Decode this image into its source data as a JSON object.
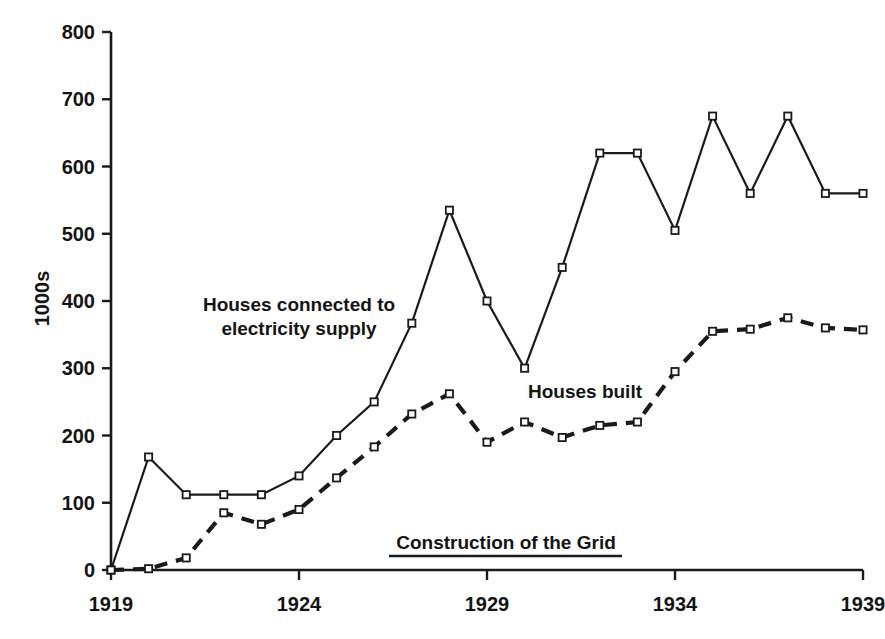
{
  "chart_data": {
    "type": "line",
    "title": "",
    "xlabel": "",
    "ylabel": "1000s",
    "xlim": [
      1919,
      1939
    ],
    "ylim": [
      0,
      800
    ],
    "grid": false,
    "legend_position": "inline-annotations",
    "x": [
      1919,
      1920,
      1921,
      1922,
      1923,
      1924,
      1925,
      1926,
      1927,
      1928,
      1929,
      1930,
      1931,
      1932,
      1933,
      1934,
      1935,
      1936,
      1937,
      1938,
      1939
    ],
    "xticks": [
      1919,
      1924,
      1929,
      1934,
      1939
    ],
    "yticks": [
      0,
      100,
      200,
      300,
      400,
      500,
      600,
      700,
      800
    ],
    "series": [
      {
        "name": "Houses connected to electricity supply",
        "style": "solid",
        "marker": "open-square",
        "color": "#1a1a1a",
        "values": [
          0,
          168,
          112,
          112,
          112,
          140,
          200,
          250,
          367,
          535,
          400,
          300,
          450,
          620,
          620,
          505,
          675,
          560,
          675,
          560,
          560
        ]
      },
      {
        "name": "Houses built",
        "style": "dashed",
        "marker": "open-square",
        "color": "#1a1a1a",
        "values": [
          0,
          2,
          18,
          85,
          68,
          90,
          137,
          183,
          232,
          262,
          190,
          220,
          197,
          215,
          220,
          295,
          355,
          358,
          375,
          360,
          357
        ]
      }
    ],
    "annotations": [
      {
        "name": "series-label-electricity",
        "text": "Houses connected to\nelectricity supply",
        "x_px": 299,
        "y_px": 317
      },
      {
        "name": "series-label-houses-built",
        "text": "Houses built",
        "x_px": 585,
        "y_px": 392
      },
      {
        "name": "period-label-grid",
        "text": "Construction of the Grid",
        "underline": true,
        "x_px": 506,
        "y_px": 543,
        "underline_x1_px": 389,
        "underline_x2_px": 622,
        "underline_y_px": 556
      }
    ]
  },
  "axes": {
    "y_title": "1000s",
    "y_tick_labels": [
      "800",
      "700",
      "600",
      "500",
      "400",
      "300",
      "200",
      "100",
      "0"
    ],
    "x_tick_labels": [
      "1919",
      "1924",
      "1929",
      "1934",
      "1939"
    ]
  }
}
